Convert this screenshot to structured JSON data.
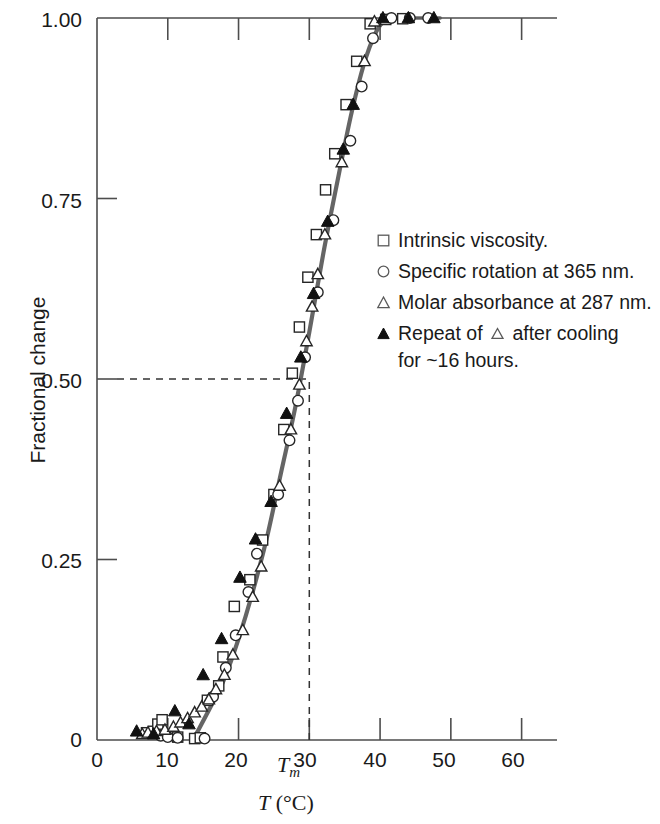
{
  "chart_data": {
    "type": "scatter",
    "title": "",
    "xlabel": "T (°C)",
    "ylabel": "Fractional change",
    "xlim": [
      0,
      65
    ],
    "ylim": [
      0,
      1.0
    ],
    "grid": false,
    "legend_position": "center-right",
    "x_ticks": [
      0,
      10,
      20,
      30,
      40,
      50,
      60
    ],
    "x_tick_labels": [
      "0",
      "10",
      "20",
      "30",
      "40",
      "50",
      "60"
    ],
    "y_ticks": [
      0,
      0.25,
      0.5,
      0.75,
      1.0
    ],
    "y_tick_labels": [
      "0",
      "0.25",
      "0.50",
      "0.75",
      "1.00"
    ],
    "annotations": [
      {
        "name": "tm-marker",
        "label": "Tm",
        "label_base": "T",
        "label_sub": "m",
        "x": 30,
        "y": 0.5,
        "note": "midpoint of transition"
      },
      {
        "name": "tm-vertical-dashed",
        "type": "vline",
        "x": 30
      },
      {
        "name": "half-horizontal-dashed",
        "type": "hline",
        "y": 0.5
      }
    ],
    "series": [
      {
        "name": "Intrinsic viscosity.",
        "marker": "open-square",
        "points": [
          [
            7.0,
            0.01
          ],
          [
            8.0,
            0.012
          ],
          [
            8.6,
            0.022
          ],
          [
            9.2,
            0.028
          ],
          [
            10.6,
            0.007
          ],
          [
            11.4,
            0.004
          ],
          [
            13.8,
            0.002
          ],
          [
            14.6,
            0.003
          ],
          [
            15.6,
            0.055
          ],
          [
            17.2,
            0.075
          ],
          [
            17.8,
            0.115
          ],
          [
            19.4,
            0.185
          ],
          [
            21.6,
            0.222
          ],
          [
            23.4,
            0.277
          ],
          [
            25.0,
            0.34
          ],
          [
            26.4,
            0.43
          ],
          [
            27.6,
            0.508
          ],
          [
            28.6,
            0.572
          ],
          [
            29.8,
            0.641
          ],
          [
            31.0,
            0.7
          ],
          [
            32.3,
            0.762
          ],
          [
            33.6,
            0.812
          ],
          [
            35.2,
            0.88
          ],
          [
            36.7,
            0.94
          ],
          [
            38.6,
            0.992
          ],
          [
            40.8,
            0.998
          ],
          [
            43.2,
            0.999
          ]
        ]
      },
      {
        "name": "Specific rotation at 365 nm.",
        "marker": "open-circle",
        "points": [
          [
            9.0,
            0.006
          ],
          [
            10.0,
            0.004
          ],
          [
            11.4,
            0.003
          ],
          [
            15.2,
            0.002
          ],
          [
            16.4,
            0.06
          ],
          [
            18.2,
            0.1
          ],
          [
            19.6,
            0.145
          ],
          [
            21.4,
            0.205
          ],
          [
            22.6,
            0.258
          ],
          [
            25.6,
            0.34
          ],
          [
            27.2,
            0.415
          ],
          [
            28.4,
            0.47
          ],
          [
            29.4,
            0.53
          ],
          [
            31.2,
            0.62
          ],
          [
            33.4,
            0.72
          ],
          [
            35.8,
            0.83
          ],
          [
            37.4,
            0.905
          ],
          [
            39.0,
            0.972
          ],
          [
            41.6,
            1.0
          ],
          [
            44.2,
            1.0
          ],
          [
            46.8,
            1.0
          ]
        ]
      },
      {
        "name": "Molar absorbance at 287 nm.",
        "marker": "open-triangle",
        "points": [
          [
            6.4,
            0.008
          ],
          [
            7.2,
            0.01
          ],
          [
            8.4,
            0.012
          ],
          [
            9.6,
            0.014
          ],
          [
            10.8,
            0.018
          ],
          [
            11.8,
            0.024
          ],
          [
            12.8,
            0.03
          ],
          [
            13.8,
            0.038
          ],
          [
            14.8,
            0.046
          ],
          [
            15.8,
            0.056
          ],
          [
            16.8,
            0.07
          ],
          [
            18.0,
            0.09
          ],
          [
            19.2,
            0.118
          ],
          [
            20.6,
            0.152
          ],
          [
            22.0,
            0.198
          ],
          [
            23.2,
            0.24
          ],
          [
            25.8,
            0.352
          ],
          [
            27.4,
            0.43
          ],
          [
            28.6,
            0.492
          ],
          [
            29.6,
            0.552
          ],
          [
            30.4,
            0.6
          ],
          [
            31.2,
            0.645
          ],
          [
            32.2,
            0.7
          ],
          [
            34.6,
            0.8
          ],
          [
            37.8,
            0.94
          ],
          [
            39.2,
            0.995
          ]
        ]
      },
      {
        "name": "Repeat of △ after cooling for ~16 hours.",
        "marker": "filled-triangle",
        "points": [
          [
            5.6,
            0.012
          ],
          [
            8.0,
            0.008
          ],
          [
            11.0,
            0.04
          ],
          [
            13.0,
            0.022
          ],
          [
            15.0,
            0.09
          ],
          [
            17.6,
            0.14
          ],
          [
            20.2,
            0.225
          ],
          [
            22.4,
            0.278
          ],
          [
            24.6,
            0.33
          ],
          [
            26.8,
            0.452
          ],
          [
            28.8,
            0.53
          ],
          [
            30.6,
            0.618
          ],
          [
            32.6,
            0.718
          ],
          [
            34.8,
            0.818
          ],
          [
            36.2,
            0.88
          ],
          [
            40.4,
            1.0
          ],
          [
            44.0,
            1.0
          ],
          [
            47.6,
            1.0
          ]
        ]
      }
    ],
    "fit_curve": {
      "name": "sigmoid-fit",
      "description": "smooth sigmoidal melting curve through all series",
      "points": [
        [
          14.0,
          0.008
        ],
        [
          16.0,
          0.045
        ],
        [
          18.0,
          0.085
        ],
        [
          20.0,
          0.14
        ],
        [
          22.0,
          0.205
        ],
        [
          24.0,
          0.28
        ],
        [
          26.0,
          0.37
        ],
        [
          28.0,
          0.46
        ],
        [
          30.0,
          0.565
        ],
        [
          32.0,
          0.675
        ],
        [
          34.0,
          0.775
        ],
        [
          36.0,
          0.87
        ],
        [
          38.0,
          0.945
        ],
        [
          40.0,
          0.99
        ],
        [
          42.0,
          1.0
        ]
      ]
    }
  },
  "axes": {
    "y_title": "Fractional change",
    "x_title_base": "T",
    "x_title_unit": "(°C)",
    "x_title_full": "T (°C)",
    "y_tick_labels": [
      "1.00",
      "0.75",
      "0.50",
      "0.25",
      "0"
    ],
    "x_tick_labels": [
      "0",
      "10",
      "20",
      "30",
      "40",
      "50",
      "60"
    ],
    "tm_base": "T",
    "tm_sub": "m"
  },
  "legend": {
    "items": [
      {
        "marker": "open-square",
        "text": "Intrinsic viscosity."
      },
      {
        "marker": "open-circle",
        "text": "Specific rotation at 365 nm."
      },
      {
        "marker": "open-triangle",
        "text": "Molar absorbance at 287 nm."
      },
      {
        "marker": "filled-triangle",
        "text_before": "Repeat of",
        "text_after": "after cooling",
        "text_line2": "for ~16 hours."
      }
    ]
  },
  "colors": {
    "axis": "#4d4d4d",
    "curve": "#585858",
    "marker_stroke": "#262626",
    "marker_fill_open": "#ffffff",
    "marker_fill_solid": "#111111",
    "text": "#1a1a1a",
    "background": "#ffffff"
  }
}
